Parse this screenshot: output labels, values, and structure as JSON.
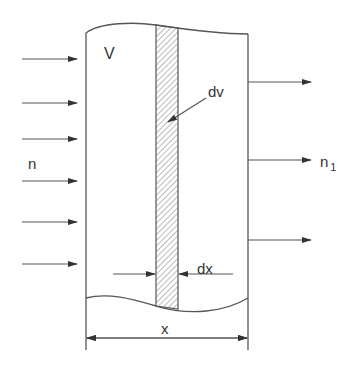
{
  "diagram": {
    "type": "slab-flux-schematic",
    "labels": {
      "volume": "V",
      "element_volume": "dv",
      "incident": "n",
      "transmitted_base": "n",
      "transmitted_sub": "1",
      "element_thickness": "dx",
      "thickness": "x"
    },
    "incoming_arrows_y": [
      59,
      103,
      139,
      181,
      222,
      264
    ],
    "outgoing_arrows_y": [
      82,
      160,
      240
    ],
    "colors": {
      "line": "#555555",
      "text": "#333333",
      "hatch": "#777777",
      "background": "#ffffff"
    }
  }
}
